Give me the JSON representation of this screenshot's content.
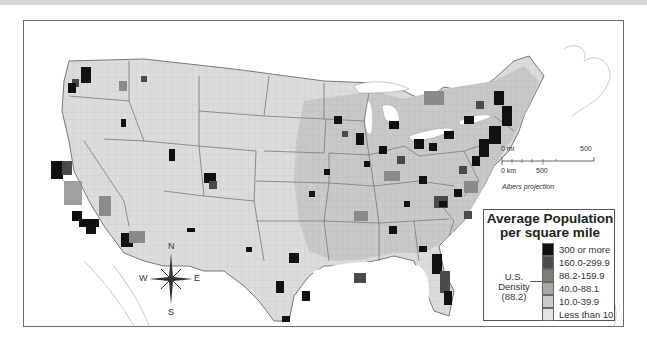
{
  "map": {
    "projection": "Albers projection",
    "scale_bar": {
      "mi_start": "0 mi",
      "mi_end": "500",
      "km_start": "0 km",
      "km_mid": "500"
    },
    "compass": {
      "n": "N",
      "s": "S",
      "e": "E",
      "w": "W"
    }
  },
  "legend": {
    "title_line1": "Average Population",
    "title_line2": "per square mile",
    "us_density_label": "U.S. Density",
    "us_density_value": "(88.2)",
    "classes": [
      {
        "label": "300 or more",
        "color": "#111111"
      },
      {
        "label": "160.0-299.9",
        "color": "#4a4a4a"
      },
      {
        "label": "88.2-159.9",
        "color": "#7d7d7d"
      },
      {
        "label": "40.0-88.1",
        "color": "#a6a6a6"
      },
      {
        "label": "10.0-39.9",
        "color": "#cacaca"
      },
      {
        "label": "Less than 10",
        "color": "#e2e2e2"
      }
    ]
  }
}
